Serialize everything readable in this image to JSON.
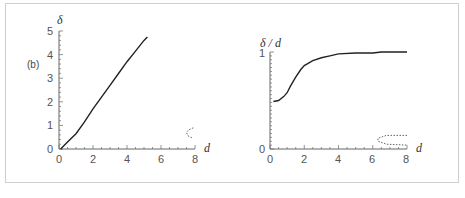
{
  "panel_label": "(b)",
  "chart_data": [
    {
      "type": "line",
      "title": "",
      "xlabel": "d",
      "ylabel": "δ",
      "xlim": [
        0,
        8
      ],
      "ylim": [
        0,
        5
      ],
      "x_ticks": [
        "0",
        "2",
        "4",
        "6",
        "8"
      ],
      "y_ticks": [
        "0",
        "1",
        "2",
        "3",
        "4",
        "5"
      ],
      "grid": false,
      "series": [
        {
          "name": "delta",
          "style": "solid",
          "x": [
            0.1,
            0.5,
            1.0,
            1.5,
            2.0,
            2.5,
            3.0,
            3.5,
            4.0,
            4.5,
            5.0,
            5.2
          ],
          "y": [
            0.0,
            0.3,
            0.65,
            1.15,
            1.7,
            2.2,
            2.7,
            3.2,
            3.7,
            4.15,
            4.6,
            4.75
          ]
        },
        {
          "name": "dashed-loop",
          "style": "dotted",
          "x": [
            7.9,
            7.6,
            7.5,
            7.6,
            7.9
          ],
          "y": [
            0.9,
            0.8,
            0.7,
            0.55,
            0.45
          ]
        }
      ]
    },
    {
      "type": "line",
      "title": "",
      "xlabel": "d",
      "ylabel": "δ / d",
      "xlim": [
        0,
        8
      ],
      "ylim": [
        0,
        1
      ],
      "x_ticks": [
        "0",
        "2",
        "4",
        "6",
        "8"
      ],
      "y_ticks": [
        "0",
        "1"
      ],
      "grid": false,
      "series": [
        {
          "name": "delta-over-d",
          "style": "solid",
          "x": [
            0.2,
            0.5,
            0.8,
            1.0,
            1.2,
            1.5,
            1.8,
            2.0,
            2.5,
            3.0,
            3.5,
            4.0,
            5.0,
            6.0,
            6.5,
            8.0
          ],
          "y": [
            0.49,
            0.5,
            0.54,
            0.58,
            0.65,
            0.74,
            0.82,
            0.86,
            0.91,
            0.94,
            0.96,
            0.98,
            0.99,
            0.99,
            1.0,
            1.0
          ]
        },
        {
          "name": "dashed-loop",
          "style": "dotted",
          "x": [
            8.0,
            6.8,
            6.3,
            6.3,
            6.8,
            8.0
          ],
          "y": [
            0.14,
            0.14,
            0.11,
            0.08,
            0.05,
            0.04
          ]
        }
      ]
    }
  ],
  "left_axis": {
    "x_ticks": [
      "0",
      "2",
      "4",
      "6",
      "8"
    ],
    "y_ticks": [
      "0",
      "1",
      "2",
      "3",
      "4",
      "5"
    ],
    "xlabel": "d",
    "ylabel": "δ"
  },
  "right_axis": {
    "x_ticks": [
      "0",
      "2",
      "4",
      "6",
      "8"
    ],
    "y_ticks": [
      "0",
      "1"
    ],
    "xlabel": "d",
    "ylabel": "δ / d"
  }
}
